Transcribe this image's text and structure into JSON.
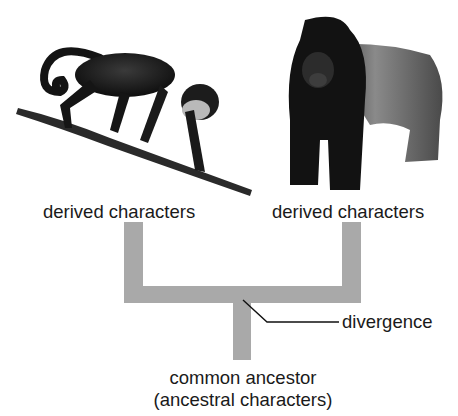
{
  "diagram": {
    "type": "phylogenetic-tree",
    "taxa": [
      {
        "name": "monkey",
        "label": "derived characters"
      },
      {
        "name": "gorilla",
        "label": "derived characters"
      }
    ],
    "node": {
      "label": "divergence"
    },
    "root": {
      "label_line1": "common ancestor",
      "label_line2": "(ancestral characters)"
    },
    "colors": {
      "branch": "#a9a9a9",
      "text": "#1a1a1a",
      "background": "#ffffff"
    }
  }
}
